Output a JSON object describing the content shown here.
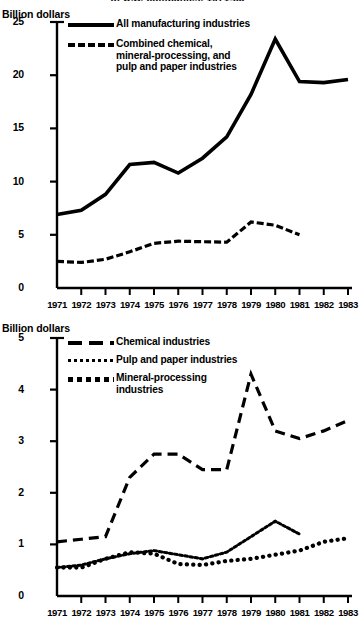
{
  "figure": {
    "clipped_title": "of U.S. companies, 1971-83",
    "top_axis_caption": "Billion dollars",
    "bottom_axis_caption": "Billion dollars"
  },
  "top_panel": {
    "y_ticks": [
      "25",
      "20",
      "15",
      "10",
      "5",
      "0"
    ],
    "x_ticks": [
      "1971",
      "1972",
      "1973",
      "1974",
      "1975",
      "1976",
      "1977",
      "1978",
      "1979",
      "1980",
      "1981",
      "1982",
      "1983"
    ],
    "legend": [
      {
        "key": "solid-line",
        "label": "All manufacturing industries"
      },
      {
        "key": "dashed-line",
        "label": "Combined chemical,\nmineral-processing, and\npulp and paper industries"
      }
    ]
  },
  "bottom_panel": {
    "y_ticks": [
      "5",
      "4",
      "3",
      "2",
      "1",
      "0"
    ],
    "x_ticks": [
      "1971",
      "1972",
      "1973",
      "1974",
      "1975",
      "1976",
      "1977",
      "1978",
      "1979",
      "1980",
      "1981",
      "1982",
      "1983"
    ],
    "legend": [
      {
        "key": "long-dash-line",
        "label": "Chemical industries"
      },
      {
        "key": "small-dot-line",
        "label": "Pulp and paper industries"
      },
      {
        "key": "big-dot-line",
        "label": "Mineral-processing\n    industries"
      }
    ]
  },
  "chart_data": [
    {
      "type": "line",
      "id": "top-chart",
      "title": "",
      "xlabel": "",
      "ylabel": "Billion dollars",
      "xlim": [
        1971,
        1983
      ],
      "ylim": [
        0,
        25
      ],
      "yticks": [
        0,
        5,
        10,
        15,
        20,
        25
      ],
      "x": [
        1971,
        1972,
        1973,
        1974,
        1975,
        1976,
        1977,
        1978,
        1979,
        1980,
        1981,
        1982,
        1983
      ],
      "grid": false,
      "legend_position": "top-left",
      "series": [
        {
          "name": "All manufacturing industries",
          "style": "solid",
          "values": [
            6.9,
            7.3,
            8.8,
            11.6,
            11.8,
            10.8,
            12.2,
            14.2,
            18.2,
            23.4,
            19.4,
            19.3,
            19.6
          ]
        },
        {
          "name": "Combined chemical, mineral-processing, and pulp and paper industries",
          "style": "dashed",
          "values": [
            2.5,
            2.4,
            2.7,
            3.4,
            4.2,
            4.4,
            4.35,
            4.3,
            6.2,
            5.9,
            5.0,
            null,
            null
          ]
        }
      ]
    },
    {
      "type": "line",
      "id": "bottom-chart",
      "title": "",
      "xlabel": "",
      "ylabel": "Billion dollars",
      "xlim": [
        1971,
        1983
      ],
      "ylim": [
        0,
        5
      ],
      "yticks": [
        0,
        1,
        2,
        3,
        4,
        5
      ],
      "x": [
        1971,
        1972,
        1973,
        1974,
        1975,
        1976,
        1977,
        1978,
        1979,
        1980,
        1981,
        1982,
        1983
      ],
      "grid": false,
      "legend_position": "top-left",
      "series": [
        {
          "name": "Chemical industries",
          "style": "long-dash",
          "values": [
            1.05,
            1.1,
            1.15,
            2.3,
            2.75,
            2.75,
            2.45,
            2.45,
            4.3,
            3.2,
            3.05,
            3.2,
            3.4
          ]
        },
        {
          "name": "Pulp and paper industries",
          "style": "small-dot",
          "values": [
            0.55,
            0.6,
            0.72,
            0.82,
            0.88,
            0.8,
            0.72,
            0.85,
            1.15,
            1.45,
            1.2,
            null,
            null
          ]
        },
        {
          "name": "Mineral-processing industries",
          "style": "big-dot",
          "values": [
            0.55,
            0.55,
            0.72,
            0.85,
            0.82,
            0.62,
            0.6,
            0.68,
            0.72,
            0.8,
            0.88,
            1.05,
            1.12
          ]
        }
      ]
    }
  ]
}
